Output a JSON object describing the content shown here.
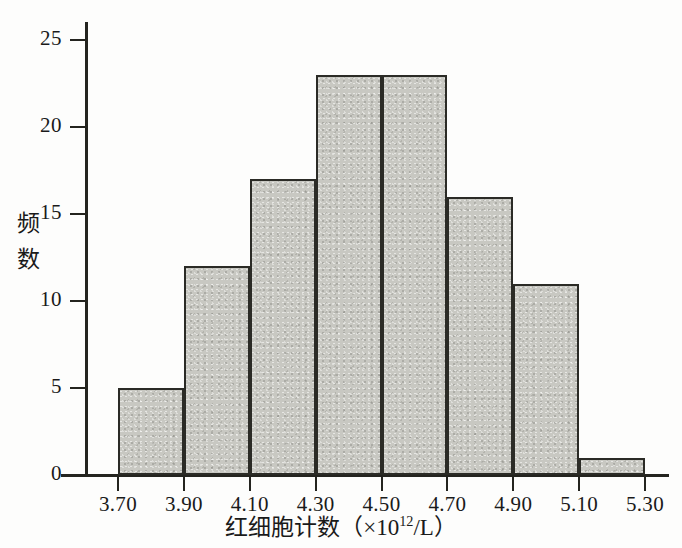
{
  "chart_data": {
    "type": "bar",
    "subtype": "histogram",
    "title": "",
    "xlabel": "红细胞计数（×10¹²/L）",
    "xlabel_parts": {
      "name": "红细胞计数",
      "open_paren": "（",
      "times": "×",
      "base": "10",
      "exponent": "12",
      "per_unit": "/L",
      "close_paren": "）"
    },
    "ylabel": "频数",
    "ylabel_chars": [
      "频",
      "数"
    ],
    "categories": [
      "3.70-3.90",
      "3.90-4.10",
      "4.10-4.30",
      "4.30-4.50",
      "4.50-4.70",
      "4.70-4.90",
      "4.90-5.10",
      "5.10-5.30"
    ],
    "bin_edges": [
      3.7,
      3.9,
      4.1,
      4.3,
      4.5,
      4.7,
      4.9,
      5.1,
      5.3
    ],
    "values": [
      5,
      12,
      17,
      23,
      23,
      16,
      11,
      1
    ],
    "bin_width": 0.2,
    "total_count": 108,
    "xtick_labels": [
      "3.70",
      "3.90",
      "4.10",
      "4.30",
      "4.50",
      "4.70",
      "4.90",
      "5.10",
      "5.30"
    ],
    "ytick_labels": [
      "0",
      "5",
      "10",
      "15",
      "20",
      "25"
    ],
    "ytick_values": [
      0,
      5,
      10,
      15,
      20,
      25
    ],
    "ylim": [
      0,
      26
    ],
    "xlim": [
      3.7,
      5.3
    ],
    "grid": false,
    "legend": null,
    "colors": {
      "bar_fill": "#c8c8c2",
      "bar_edge": "#2b2b26",
      "axis": "#24241f",
      "text": "#1a1a1a",
      "background": "#fdfdfc"
    }
  }
}
